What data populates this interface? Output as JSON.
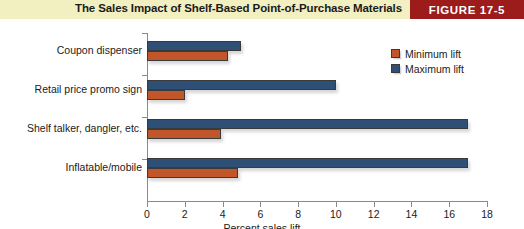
{
  "header": {
    "title": "The Sales Impact of Shelf-Based Point-of-Purchase Materials",
    "badge": "FIGURE 17-5",
    "band_color": "#f2efc0",
    "badge_color": "#9c1b1b"
  },
  "legend": {
    "position": "top-right",
    "items": [
      {
        "label": "Minimum lift",
        "color": "#c0562a",
        "swatch_name": "legend-swatch-minimum"
      },
      {
        "label": "Maximum lift",
        "color": "#2e5077",
        "swatch_name": "legend-swatch-maximum"
      }
    ]
  },
  "chart_data": {
    "type": "bar",
    "orientation": "horizontal",
    "title": "The Sales Impact of Shelf-Based Point-of-Purchase Materials",
    "xlabel": "Percent sales lift",
    "ylabel": "",
    "xlim": [
      0,
      18
    ],
    "xticks": [
      0,
      2,
      4,
      6,
      8,
      10,
      12,
      14,
      16,
      18
    ],
    "xtick_labels": [
      "0",
      "2",
      "4",
      "6",
      "8",
      "10",
      "12",
      "14",
      "16",
      "18"
    ],
    "grid": false,
    "legend_position": "top-right",
    "categories": [
      "Coupon dispenser",
      "Retail price promo sign",
      "Shelf talker, dangler, etc.",
      "Inflatable/mobile"
    ],
    "series": [
      {
        "name": "Maximum lift",
        "color": "#2e5077",
        "values": [
          5.0,
          10.0,
          17.0,
          17.0
        ]
      },
      {
        "name": "Minimum lift",
        "color": "#c0562a",
        "values": [
          4.3,
          2.0,
          3.9,
          4.8
        ]
      }
    ]
  }
}
